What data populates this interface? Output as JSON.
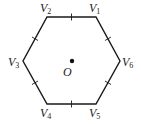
{
  "diagram": {
    "type": "regular-hexagon",
    "stroke_color": "#1a1a1a",
    "center": {
      "label": "O",
      "x": 72,
      "y": 61
    },
    "vertices": [
      {
        "id": "V1",
        "base": "V",
        "sub": "1",
        "x": 96,
        "y": 17
      },
      {
        "id": "V2",
        "base": "V",
        "sub": "2",
        "x": 47,
        "y": 17
      },
      {
        "id": "V3",
        "base": "V",
        "sub": "3",
        "x": 23,
        "y": 61
      },
      {
        "id": "V4",
        "base": "V",
        "sub": "4",
        "x": 47,
        "y": 104
      },
      {
        "id": "V5",
        "base": "V",
        "sub": "5",
        "x": 96,
        "y": 104
      },
      {
        "id": "V6",
        "base": "V",
        "sub": "6",
        "x": 120,
        "y": 61
      }
    ],
    "edge_tick_marks": 6
  }
}
